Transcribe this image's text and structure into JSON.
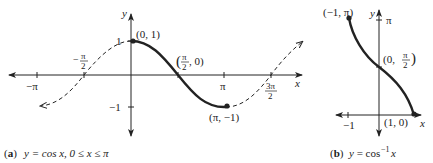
{
  "figure_a": {
    "caption_prefix": "(a)",
    "caption_text": "y = cos x, 0 ≤ x ≤ π",
    "axis_x_label": "x",
    "axis_y_label": "y",
    "ticks_x": [
      "−π",
      "−π/2",
      "π",
      "3π/2"
    ],
    "tick_y_pos": "1",
    "tick_y_neg": "−1",
    "points": {
      "max": "(0, 1)",
      "zero": "(π/2, 0)",
      "min": "(π, −1)"
    },
    "zero_label_num": "π",
    "zero_label_den": "2",
    "zero_label_rest": ", 0)",
    "neg_half_pi_num": "π",
    "neg_half_pi_den": "2",
    "three_half_pi_num": "3π",
    "three_half_pi_den": "2"
  },
  "figure_b": {
    "caption_prefix": "(b)",
    "caption_text": "y = cos",
    "caption_sup": "−1",
    "caption_var": "x",
    "axis_x_label": "x",
    "axis_y_label": "y",
    "tick_x_neg": "−1",
    "tick_y_pi": "π",
    "points": {
      "top": "(−1, π)",
      "mid_prefix": "(0, ",
      "mid_num": "π",
      "mid_den": "2",
      "bottom": "(1, 0)"
    }
  },
  "colors": {
    "ink": "#222222"
  }
}
